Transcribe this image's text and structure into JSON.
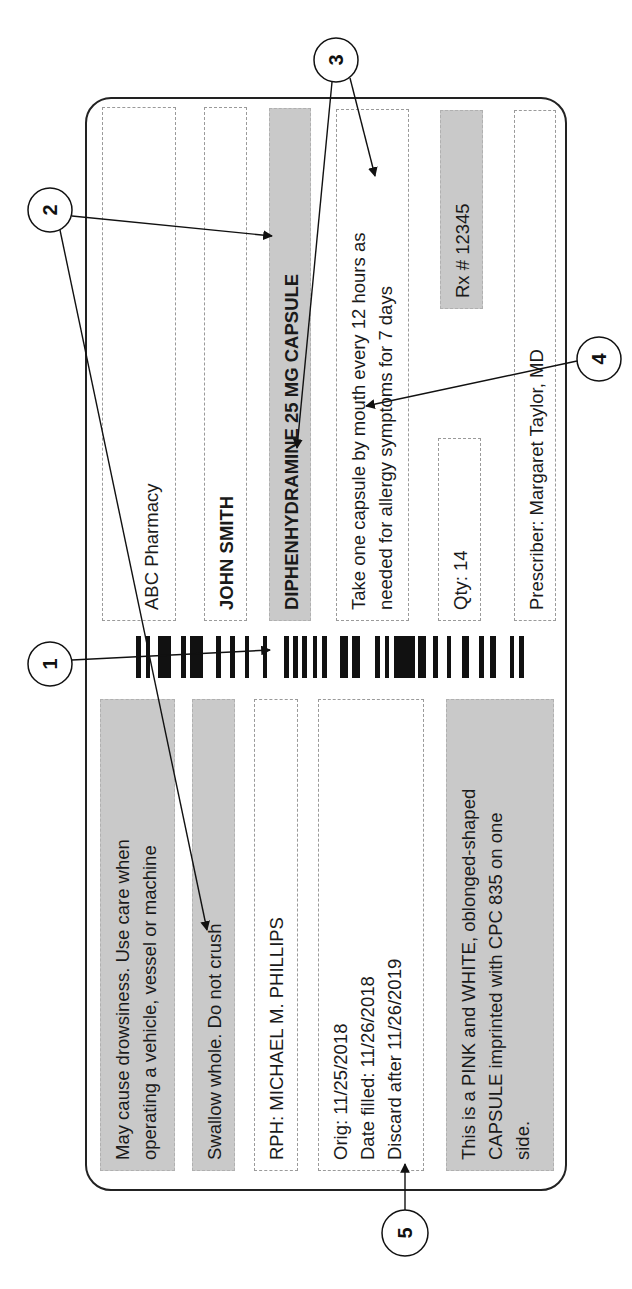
{
  "label": {
    "pharmacy_name": "ABC Pharmacy",
    "pharmacy_address": "1111 West street, City, ST, 55555",
    "patient_name": "JOHN SMITH",
    "drug_name": "DIPHENHYDRAMINE 25 MG CAPSULE",
    "directions": "Take one capsule by mouth every 12 hours as\nneeded for allergy symptoms for 7 days",
    "quantity": "Qty: 14",
    "rx_number": "Rx # 12345",
    "prescriber": "Prescriber: Margaret Taylor, MD",
    "warning_drowsiness": "May cause drowsiness. Use care when\noperating a vehicle, vessel or machine",
    "warning_swallow": "Swallow whole. Do not crush",
    "pharmacist": "RPH: MICHAEL M. PHILLIPS",
    "dates": "Orig: 11/25/2018\nDate filled: 11/26/2018\nDiscard after 11/26/2019",
    "description": "This is a PINK and WHITE, oblonged-shaped\nCAPSULE imprinted with CPC 835 on one\nside."
  },
  "callouts": [
    {
      "number": "1"
    },
    {
      "number": "2"
    },
    {
      "number": "3"
    },
    {
      "number": "4"
    },
    {
      "number": "5"
    }
  ],
  "barcode_bars": [
    [
      136,
      5
    ],
    [
      146,
      4
    ],
    [
      158,
      13
    ],
    [
      181,
      5
    ],
    [
      190,
      13
    ],
    [
      216,
      5
    ],
    [
      230,
      5
    ],
    [
      245,
      4
    ],
    [
      263,
      4
    ],
    [
      284,
      5
    ],
    [
      293,
      5
    ],
    [
      302,
      5
    ],
    [
      313,
      4
    ],
    [
      322,
      5
    ],
    [
      340,
      8
    ],
    [
      352,
      8
    ],
    [
      375,
      5
    ],
    [
      385,
      4
    ],
    [
      394,
      21
    ],
    [
      418,
      8
    ],
    [
      433,
      5
    ],
    [
      447,
      4
    ],
    [
      462,
      7
    ],
    [
      479,
      5
    ],
    [
      490,
      6
    ],
    [
      510,
      4
    ],
    [
      519,
      5
    ]
  ],
  "colors": {
    "highlight_gray": "#c9c9c9",
    "text": "#1a1a1a",
    "border": "#222222"
  }
}
